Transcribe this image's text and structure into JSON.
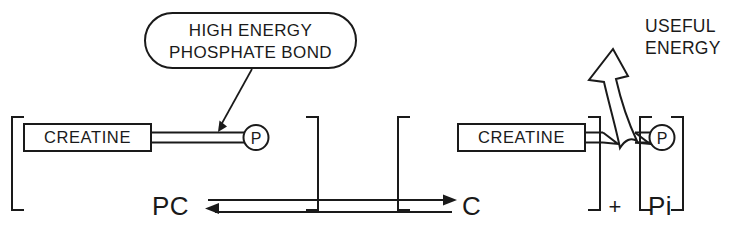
{
  "diagram": {
    "callout": {
      "name": "high-energy-phosphate-bond-callout",
      "line1": "HIGH ENERGY",
      "line2": "PHOSPHATE BOND"
    },
    "reactant_group": {
      "molecule_label": "CREATINE",
      "phosphate_label": "P",
      "species_label": "PC"
    },
    "product_group": {
      "molecule_label": "CREATINE",
      "phosphate_label": "P",
      "species_label": "C",
      "plus_sign": "+",
      "inorganic_phosphate_label": "Pi"
    },
    "energy_annotation": {
      "line1": "USEFUL",
      "line2": "ENERGY"
    },
    "colors": {
      "ink": "#1a1a1a",
      "background": "#ffffff"
    }
  }
}
